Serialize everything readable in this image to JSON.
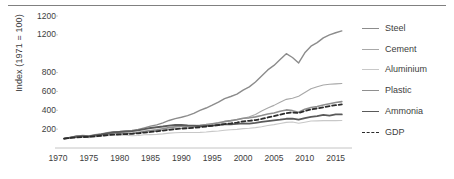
{
  "chart_data": {
    "type": "line",
    "title": "",
    "xlabel": "",
    "ylabel": "Index (1971 = 100)",
    "xlim": [
      1970,
      2017
    ],
    "ylim": [
      0,
      1400
    ],
    "grid": false,
    "legend_position": "right",
    "x_ticks": [
      "1970",
      "1975",
      "1980",
      "1985",
      "1990",
      "1995",
      "2000",
      "2005",
      "2010",
      "2015"
    ],
    "x_tick_values": [
      1970,
      1975,
      1980,
      1985,
      1990,
      1995,
      2000,
      2005,
      2010,
      2015
    ],
    "y_ticks": [
      "1200",
      "1200",
      "800",
      "600",
      "400",
      "200"
    ],
    "y_tick_values": [
      1400,
      1200,
      800,
      600,
      400,
      200
    ],
    "x": [
      1971,
      1972,
      1973,
      1974,
      1975,
      1976,
      1977,
      1978,
      1979,
      1980,
      1981,
      1982,
      1983,
      1984,
      1985,
      1986,
      1987,
      1988,
      1989,
      1990,
      1991,
      1992,
      1993,
      1994,
      1995,
      1996,
      1997,
      1998,
      1999,
      2000,
      2001,
      2002,
      2003,
      2004,
      2005,
      2006,
      2007,
      2008,
      2009,
      2010,
      2011,
      2012,
      2013,
      2014,
      2015,
      2016
    ],
    "series": [
      {
        "name": "Steel",
        "color": "#8c8c8c",
        "width": 1.4,
        "dash": "none",
        "values": [
          100,
          112,
          124,
          132,
          128,
          140,
          150,
          162,
          172,
          176,
          182,
          186,
          196,
          214,
          232,
          246,
          266,
          292,
          312,
          326,
          344,
          368,
          398,
          424,
          454,
          486,
          524,
          546,
          572,
          614,
          648,
          700,
          764,
          828,
          876,
          938,
          1000,
          960,
          902,
          1010,
          1080,
          1118,
          1168,
          1200,
          1222,
          1242
        ]
      },
      {
        "name": "Cement",
        "color": "#a8a8a8",
        "width": 1.1,
        "dash": "none",
        "values": [
          100,
          108,
          116,
          120,
          120,
          128,
          136,
          144,
          150,
          152,
          152,
          152,
          158,
          164,
          172,
          180,
          188,
          198,
          206,
          210,
          214,
          220,
          232,
          244,
          254,
          264,
          276,
          286,
          298,
          312,
          332,
          356,
          392,
          424,
          452,
          486,
          516,
          528,
          548,
          588,
          628,
          650,
          668,
          676,
          680,
          684
        ]
      },
      {
        "name": "Aluminium",
        "color": "#c8c8c8",
        "width": 1.1,
        "dash": "none",
        "values": [
          100,
          106,
          114,
          118,
          110,
          116,
          124,
          130,
          136,
          138,
          136,
          130,
          132,
          140,
          142,
          144,
          150,
          158,
          162,
          164,
          164,
          164,
          166,
          170,
          176,
          180,
          188,
          194,
          198,
          206,
          210,
          216,
          226,
          238,
          248,
          260,
          272,
          276,
          262,
          274,
          286,
          288,
          290,
          292,
          290,
          292
        ]
      },
      {
        "name": "Plastic",
        "color": "#8f8f8f",
        "width": 1.6,
        "dash": "none",
        "values": [
          100,
          112,
          126,
          126,
          118,
          132,
          140,
          150,
          160,
          160,
          158,
          156,
          164,
          176,
          184,
          192,
          204,
          216,
          224,
          230,
          232,
          236,
          240,
          248,
          258,
          268,
          282,
          290,
          302,
          316,
          320,
          330,
          344,
          360,
          372,
          390,
          404,
          396,
          380,
          412,
          430,
          440,
          456,
          470,
          482,
          492
        ]
      },
      {
        "name": "Ammonia",
        "color": "#5a5a5a",
        "width": 1.8,
        "dash": "none",
        "values": [
          100,
          110,
          120,
          126,
          124,
          134,
          144,
          156,
          166,
          172,
          176,
          178,
          186,
          200,
          212,
          220,
          228,
          238,
          244,
          246,
          240,
          236,
          232,
          234,
          238,
          244,
          250,
          252,
          256,
          262,
          258,
          266,
          276,
          286,
          294,
          300,
          310,
          312,
          300,
          318,
          330,
          338,
          352,
          344,
          356,
          356
        ]
      },
      {
        "name": "GDP",
        "color": "#2b2b2b",
        "width": 1.8,
        "dash": "dashed",
        "values": [
          100,
          106,
          112,
          116,
          118,
          124,
          130,
          136,
          142,
          144,
          148,
          150,
          156,
          164,
          170,
          176,
          184,
          192,
          200,
          206,
          210,
          214,
          220,
          228,
          236,
          244,
          254,
          260,
          270,
          282,
          288,
          296,
          308,
          324,
          338,
          354,
          370,
          376,
          372,
          392,
          408,
          420,
          432,
          444,
          454,
          462
        ]
      }
    ]
  },
  "legend": {
    "items": [
      {
        "label": "Steel"
      },
      {
        "label": "Cement"
      },
      {
        "label": "Aluminium"
      },
      {
        "label": "Plastic"
      },
      {
        "label": "Ammonia"
      },
      {
        "label": "GDP"
      }
    ]
  }
}
